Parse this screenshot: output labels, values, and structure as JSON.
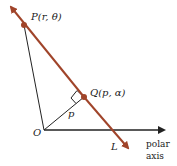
{
  "diagram": {
    "points": {
      "P": {
        "label": "P(r, θ)"
      },
      "Q": {
        "label": "Q(p, α)"
      },
      "O": {
        "label": "O"
      }
    },
    "segment_label": "p",
    "line_label": "L",
    "axis_label_line1": "polar",
    "axis_label_line2": "axis",
    "colors": {
      "line": "#a0442a",
      "ink": "#222222"
    }
  }
}
